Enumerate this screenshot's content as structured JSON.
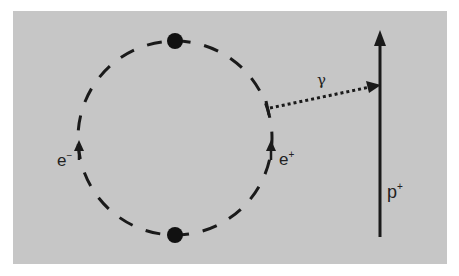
{
  "diagram": {
    "background_color": "#c6c6c6",
    "ink_color": "#1a1a1a",
    "ring": {
      "description": "dashed circular orbit",
      "particles": [
        {
          "name": "top-particle"
        },
        {
          "name": "bottom-particle"
        }
      ]
    },
    "labels": {
      "electron": "e",
      "electron_sup": "−",
      "positron": "e",
      "positron_sup": "+",
      "photon": "γ",
      "proton": "p",
      "proton_sup": "+"
    }
  }
}
